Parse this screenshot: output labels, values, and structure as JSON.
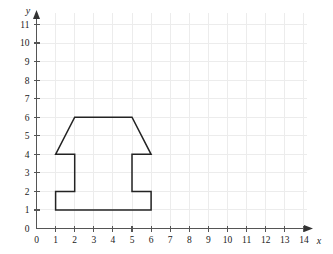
{
  "chart_data": {
    "type": "scatter",
    "title": "",
    "xlabel": "x",
    "ylabel": "y",
    "xlim": [
      0,
      14
    ],
    "ylim": [
      0,
      11
    ],
    "grid": true,
    "legend": null,
    "x_ticks": [
      "0",
      "1",
      "2",
      "3",
      "4",
      "5",
      "6",
      "7",
      "8",
      "9",
      "10",
      "11",
      "12",
      "13",
      "14"
    ],
    "y_ticks": [
      "0",
      "1",
      "2",
      "3",
      "4",
      "5",
      "6",
      "7",
      "8",
      "9",
      "10",
      "11"
    ],
    "x_tick_values": [
      0,
      1,
      2,
      3,
      4,
      5,
      6,
      7,
      8,
      9,
      10,
      11,
      12,
      13,
      14
    ],
    "y_tick_values": [
      0,
      1,
      2,
      3,
      4,
      5,
      6,
      7,
      8,
      9,
      10,
      11
    ],
    "shapes": [
      {
        "name": "polygon",
        "closed": true,
        "stroke": "#232323",
        "fill": "none",
        "points": [
          [
            1,
            4
          ],
          [
            2,
            6
          ],
          [
            5,
            6
          ],
          [
            6,
            4
          ],
          [
            5,
            4
          ],
          [
            5,
            2
          ],
          [
            6,
            2
          ],
          [
            6,
            1
          ],
          [
            1,
            1
          ],
          [
            1,
            2
          ],
          [
            2,
            2
          ],
          [
            2,
            4
          ]
        ]
      }
    ],
    "axis_style": {
      "x_arrow": true,
      "y_arrow": true,
      "grid_color": "#ececec",
      "axis_color": "#555555"
    }
  }
}
